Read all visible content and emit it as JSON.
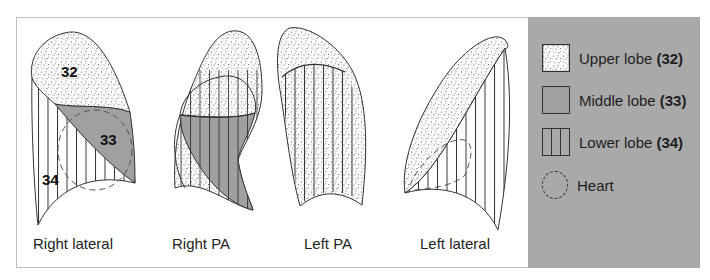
{
  "views": [
    {
      "id": "right-lateral",
      "label": "Right lateral"
    },
    {
      "id": "right-pa",
      "label": "Right PA"
    },
    {
      "id": "left-pa",
      "label": "Left PA"
    },
    {
      "id": "left-lateral",
      "label": "Left lateral"
    }
  ],
  "lobe_numbers": {
    "upper": "32",
    "middle": "33",
    "lower": "34"
  },
  "legend": {
    "items": [
      {
        "key": "upper",
        "label": "Upper lobe",
        "number": "(32)",
        "pattern": "stippled"
      },
      {
        "key": "middle",
        "label": "Middle lobe",
        "number": "(33)",
        "pattern": "solid-grey"
      },
      {
        "key": "lower",
        "label": "Lower lobe",
        "number": "(34)",
        "pattern": "vertical-lines"
      },
      {
        "key": "heart",
        "label": "Heart",
        "number": "",
        "pattern": "dashed-circle"
      }
    ]
  },
  "colors": {
    "legend_background": "#a9a9a9",
    "middle_lobe": "#a0a0a0",
    "outline": "#333333",
    "frame_border": "#bdbdbd"
  }
}
